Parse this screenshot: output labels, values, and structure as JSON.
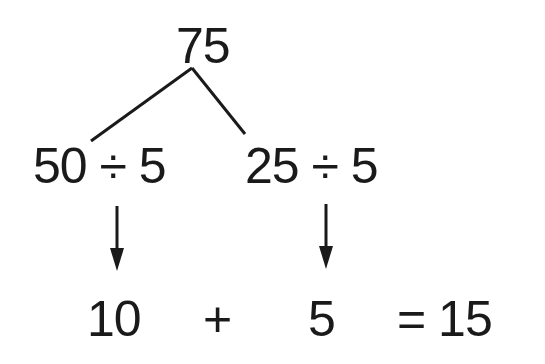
{
  "diagram": {
    "root": "75",
    "branches": [
      {
        "expression": "50 ÷ 5",
        "result": "10"
      },
      {
        "expression": "25 ÷ 5",
        "result": "5"
      }
    ],
    "operator": "+",
    "total": "= 15"
  }
}
